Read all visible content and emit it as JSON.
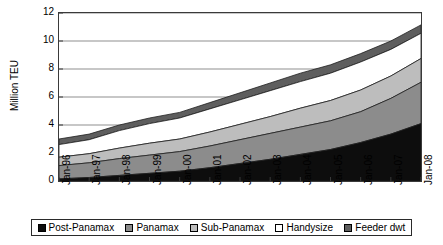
{
  "chart_data": {
    "type": "area",
    "title": "",
    "xlabel": "",
    "ylabel": "Million TEU",
    "ylim": [
      0,
      12
    ],
    "yticks": [
      0,
      2,
      4,
      6,
      8,
      10,
      12
    ],
    "grid": true,
    "stacked": true,
    "legend_position": "bottom",
    "categories": [
      "Jan-96",
      "Jan-97",
      "Jan-98",
      "Jan-99",
      "Jan-00",
      "Jan-01",
      "Jan-02",
      "Jan-03",
      "Jan-04",
      "Jan-05",
      "Jan-06",
      "Jan-07",
      "Jan-08"
    ],
    "series": [
      {
        "name": "Post-Panamax",
        "color": "#0d0d0d",
        "values": [
          0.15,
          0.25,
          0.4,
          0.55,
          0.7,
          0.95,
          1.25,
          1.55,
          1.9,
          2.25,
          2.75,
          3.35,
          4.1
        ]
      },
      {
        "name": "Panamax",
        "color": "#8c8c8c",
        "values": [
          0.95,
          1.05,
          1.2,
          1.3,
          1.4,
          1.55,
          1.7,
          1.85,
          1.95,
          2.05,
          2.2,
          2.55,
          2.95
        ]
      },
      {
        "name": "Sub-Panamax",
        "color": "#bdbdbd",
        "values": [
          0.6,
          0.65,
          0.75,
          0.85,
          0.9,
          1.0,
          1.1,
          1.2,
          1.35,
          1.45,
          1.55,
          1.6,
          1.7
        ]
      },
      {
        "name": "Handysize",
        "color": "#ffffff",
        "values": [
          0.9,
          1.0,
          1.25,
          1.4,
          1.5,
          1.65,
          1.75,
          1.85,
          1.9,
          1.95,
          2.0,
          1.9,
          1.8
        ]
      },
      {
        "name": "Feeder dwt",
        "color": "#5e5e5e",
        "values": [
          0.4,
          0.4,
          0.4,
          0.4,
          0.4,
          0.45,
          0.5,
          0.55,
          0.6,
          0.6,
          0.6,
          0.6,
          0.6
        ]
      }
    ],
    "cumulative_tops": {
      "Post-Panamax": [
        0.15,
        0.25,
        0.4,
        0.55,
        0.7,
        0.95,
        1.25,
        1.55,
        1.9,
        2.25,
        2.75,
        3.35,
        4.1
      ],
      "Panamax": [
        1.1,
        1.3,
        1.6,
        1.85,
        2.1,
        2.5,
        2.95,
        3.4,
        3.85,
        4.3,
        4.95,
        5.9,
        7.05
      ],
      "Sub-Panamax": [
        1.7,
        1.95,
        2.35,
        2.7,
        3.0,
        3.5,
        4.05,
        4.6,
        5.2,
        5.75,
        6.5,
        7.5,
        8.75
      ],
      "Handysize": [
        2.6,
        2.95,
        3.6,
        4.1,
        4.5,
        5.15,
        5.8,
        6.45,
        7.1,
        7.7,
        8.5,
        9.4,
        10.55
      ],
      "Feeder dwt": [
        3.0,
        3.35,
        4.0,
        4.5,
        4.9,
        5.6,
        6.3,
        7.0,
        7.7,
        8.3,
        9.1,
        10.0,
        11.15
      ]
    }
  },
  "legend": {
    "items": [
      {
        "label": "Post-Panamax",
        "color": "#0d0d0d"
      },
      {
        "label": "Panamax",
        "color": "#8c8c8c"
      },
      {
        "label": "Sub-Panamax",
        "color": "#bdbdbd"
      },
      {
        "label": "Handysize",
        "color": "#ffffff"
      },
      {
        "label": "Feeder dwt",
        "color": "#5e5e5e"
      }
    ]
  },
  "axes": {
    "y_title": "Million TEU",
    "y_tick_labels": [
      "0",
      "2",
      "4",
      "6",
      "8",
      "10",
      "12"
    ],
    "x_tick_labels": [
      "Jan-96",
      "Jan-97",
      "Jan-98",
      "Jan-99",
      "Jan-00",
      "Jan-01",
      "Jan-02",
      "Jan-03",
      "Jan-04",
      "Jan-05",
      "Jan-06",
      "Jan-07",
      "Jan-08"
    ]
  },
  "colors": {
    "axis": "#3a3a3a",
    "grid": "#8f8f8f",
    "background": "#ffffff",
    "text": "#000000"
  }
}
